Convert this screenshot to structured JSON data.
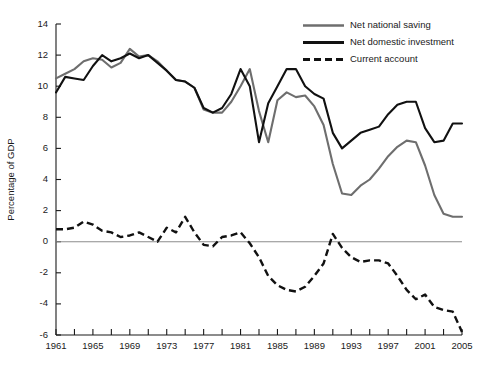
{
  "chart_data": {
    "type": "line",
    "title": "",
    "xlabel": "",
    "ylabel": "Percentage of GDP",
    "xlim": [
      1961,
      2005
    ],
    "ylim": [
      -6,
      14
    ],
    "ytick_labels": [
      "14",
      "12",
      "10",
      "8",
      "6",
      "4",
      "2",
      "0",
      "-2",
      "-4",
      "-6"
    ],
    "ytick_values": [
      14,
      12,
      10,
      8,
      6,
      4,
      2,
      0,
      -2,
      -4,
      -6
    ],
    "xtick_values": [
      1961,
      1963,
      1965,
      1967,
      1969,
      1971,
      1973,
      1975,
      1977,
      1979,
      1981,
      1983,
      1985,
      1987,
      1989,
      1991,
      1993,
      1995,
      1997,
      1999,
      2001,
      2003,
      2005
    ],
    "xtick_labels_shown": [
      "1961",
      "1965",
      "1969",
      "1973",
      "1977",
      "1981",
      "1985",
      "1989",
      "1993",
      "1997",
      "2001",
      "2005"
    ],
    "grid": false,
    "zero_line": true,
    "legend_position": "top-right",
    "x": [
      1961,
      1962,
      1963,
      1964,
      1965,
      1966,
      1967,
      1968,
      1969,
      1970,
      1971,
      1972,
      1973,
      1974,
      1975,
      1976,
      1977,
      1978,
      1979,
      1980,
      1981,
      1982,
      1983,
      1984,
      1985,
      1986,
      1987,
      1988,
      1989,
      1990,
      1991,
      1992,
      1993,
      1994,
      1995,
      1996,
      1997,
      1998,
      1999,
      2000,
      2001,
      2002,
      2003,
      2004,
      2005
    ],
    "series": [
      {
        "name": "Net national saving",
        "color": "#6e6e6e",
        "style": "solid",
        "values": [
          10.5,
          10.8,
          11.1,
          11.6,
          11.8,
          11.7,
          11.2,
          11.5,
          12.4,
          11.9,
          12.0,
          11.6,
          11.0,
          10.4,
          10.3,
          9.9,
          8.5,
          8.3,
          8.3,
          9.0,
          10.0,
          11.1,
          8.4,
          6.4,
          9.1,
          9.6,
          9.3,
          9.4,
          8.7,
          7.5,
          5.0,
          3.1,
          3.0,
          3.6,
          4.0,
          4.7,
          5.5,
          6.1,
          6.5,
          6.4,
          4.9,
          3.0,
          1.8,
          1.6,
          1.6
        ]
      },
      {
        "name": "Net  domestic investment",
        "color": "#111111",
        "style": "solid",
        "values": [
          9.6,
          10.6,
          10.5,
          10.4,
          11.3,
          12.0,
          11.6,
          11.8,
          12.1,
          11.8,
          12.0,
          11.5,
          11.0,
          10.4,
          10.3,
          9.9,
          8.6,
          8.3,
          8.6,
          9.5,
          11.1,
          10.0,
          6.4,
          8.9,
          10.0,
          11.1,
          11.1,
          10.0,
          9.5,
          9.2,
          7.0,
          6.0,
          6.5,
          7.0,
          7.2,
          7.4,
          8.2,
          8.8,
          9.0,
          9.0,
          7.3,
          6.4,
          6.5,
          7.6,
          7.6
        ]
      },
      {
        "name": "Current account",
        "color": "#111111",
        "style": "dashed",
        "values": [
          0.8,
          0.8,
          0.9,
          1.3,
          1.1,
          0.7,
          0.6,
          0.3,
          0.4,
          0.6,
          0.3,
          0.0,
          0.9,
          0.6,
          1.6,
          0.6,
          -0.2,
          -0.3,
          0.3,
          0.4,
          0.6,
          -0.1,
          -1.0,
          -2.2,
          -2.8,
          -3.1,
          -3.2,
          -2.9,
          -2.2,
          -1.4,
          0.5,
          -0.4,
          -1.0,
          -1.3,
          -1.2,
          -1.2,
          -1.4,
          -2.2,
          -3.1,
          -3.7,
          -3.4,
          -4.2,
          -4.4,
          -4.5,
          -5.8
        ]
      }
    ],
    "legend": [
      {
        "label": "Net national saving",
        "swatch": "solid-gray"
      },
      {
        "label": "Net  domestic investment",
        "swatch": "solid-black"
      },
      {
        "label": "Current account",
        "swatch": "dashed-black"
      }
    ]
  }
}
